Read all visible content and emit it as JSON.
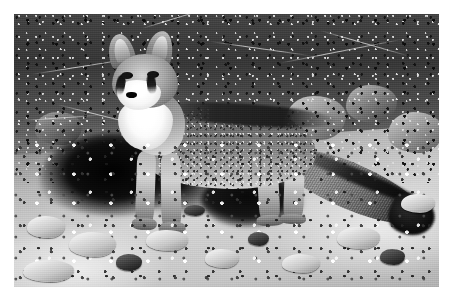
{
  "document": {
    "type": "photograph",
    "medium": "black-and-white photograph",
    "orientation": "landscape",
    "border": {
      "style": "white mat border",
      "color": "#ffffff",
      "thickness_px": 14
    },
    "canvas": {
      "width_px": 454,
      "height_px": 300
    },
    "photo_area": {
      "x": 14,
      "y": 14,
      "width": 425,
      "height": 273
    }
  },
  "scene": {
    "subject": "gray fox",
    "subject_pose": "standing in profile facing left, head turned toward camera",
    "setting": "rocky arid hillside at the mouth of a den",
    "lighting": "bright direct sunlight from the left",
    "palette": {
      "black": "#0c0c0c",
      "shadow": "#1c1c1c",
      "dark_gray": "#3b3b3b",
      "mid_gray": "#8a8a8a",
      "light_gray": "#cfcfcf",
      "white": "#ffffff"
    },
    "regions": [
      {
        "name": "upper-brush",
        "label": "dense dark brush and dry branches"
      },
      {
        "name": "background-boulders",
        "label": "sunlit boulders behind the fox"
      },
      {
        "name": "den-shadow",
        "label": "deep black shadow of the den opening"
      },
      {
        "name": "foreground-gravel",
        "label": "bright rocky gravel ground"
      }
    ],
    "subject_parts": [
      {
        "name": "ears",
        "label": "large erect pointed ears"
      },
      {
        "name": "face-mask",
        "label": "dark facial stripes from eyes to muzzle"
      },
      {
        "name": "muzzle",
        "label": "white muzzle with black nose"
      },
      {
        "name": "throat-bib",
        "label": "white throat and chest"
      },
      {
        "name": "body",
        "label": "grizzled salt-and-pepper gray coat"
      },
      {
        "name": "dorsal-stripe",
        "label": "black stripe along the back"
      },
      {
        "name": "tail",
        "label": "long bushy tail with black tip"
      },
      {
        "name": "legs",
        "label": "four slender legs on the gravel"
      }
    ]
  },
  "caption": ""
}
